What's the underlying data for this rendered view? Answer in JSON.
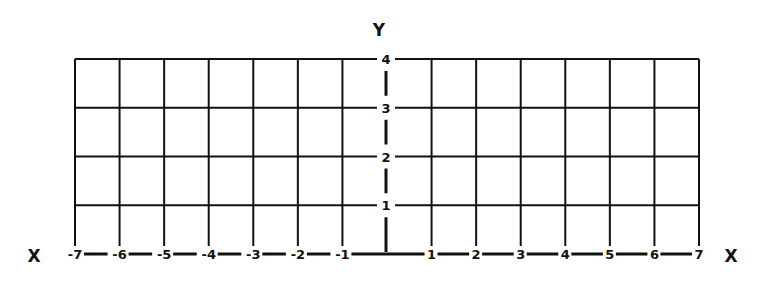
{
  "chart_data": {
    "type": "grid",
    "title": "",
    "xlabel": "X",
    "ylabel": "Y",
    "x_ticks": [
      "-7",
      "-6",
      "-5",
      "-4",
      "-3",
      "-2",
      "-1",
      "1",
      "2",
      "3",
      "4",
      "5",
      "6",
      "7"
    ],
    "y_ticks": [
      "1",
      "2",
      "3",
      "4"
    ],
    "xlim": [
      -7,
      7
    ],
    "ylim": [
      0,
      4
    ],
    "grid": true,
    "series": []
  },
  "labels": {
    "x_left": "X",
    "x_right": "X",
    "y_top": "Y"
  },
  "colors": {
    "line": "#111111",
    "background": "#ffffff"
  }
}
